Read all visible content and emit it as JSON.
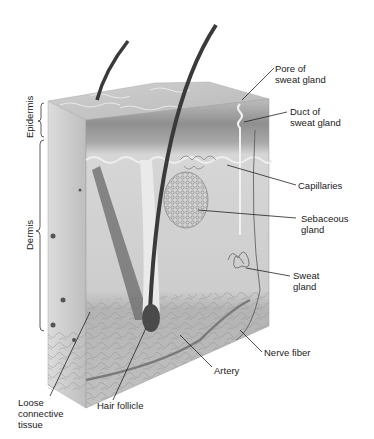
{
  "figure": {
    "layers": [
      {
        "id": "epidermis",
        "label": "Epidermis"
      },
      {
        "id": "dermis",
        "label": "Dermis"
      }
    ],
    "callouts": [
      {
        "id": "pore",
        "label": "Pore of\nsweat gland"
      },
      {
        "id": "duct",
        "label": "Duct of\nsweat gland"
      },
      {
        "id": "capillaries",
        "label": "Capillaries"
      },
      {
        "id": "sebaceous",
        "label": "Sebaceous\ngland"
      },
      {
        "id": "sweat",
        "label": "Sweat\ngland"
      },
      {
        "id": "nerve",
        "label": "Nerve fiber"
      },
      {
        "id": "artery",
        "label": "Artery"
      },
      {
        "id": "follicle",
        "label": "Hair follicle"
      },
      {
        "id": "loose",
        "label": "Loose\nconnective\ntissue"
      }
    ],
    "colors": {
      "epidermis_top": "#d4d4d4",
      "epidermis_band": "#9a9a9a",
      "dermis": "#cfcfcf",
      "hypodermis": "#bdbdbd",
      "hair": "#3a3a3a",
      "leader": "#222222"
    }
  }
}
